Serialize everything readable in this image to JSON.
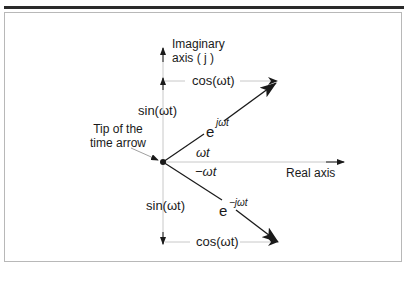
{
  "figure": {
    "imag_axis_label": [
      "Imaginary",
      "axis ( j )"
    ],
    "real_axis_label": "Real axis",
    "tip_label": [
      "Tip of the",
      "time arrow"
    ],
    "upper": {
      "cos_label": "cos(ωt)",
      "sin_label": "sin(ωt)",
      "exp_base": "e",
      "exp_sup": "jωt",
      "angle_label": "ωt"
    },
    "lower": {
      "cos_label": "cos(ωt)",
      "sin_label": "sin(ωt)",
      "exp_base": "e",
      "exp_sup": "−jωt",
      "angle_label": "−ωt"
    }
  },
  "colors": {
    "frame": "#b8b8b8",
    "bar": "#2a2a2a",
    "axis": "#c8c8c8",
    "vector": "#1a1a1a"
  }
}
